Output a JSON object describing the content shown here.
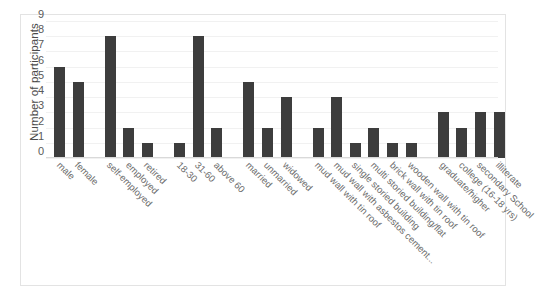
{
  "chart_data": {
    "type": "bar",
    "title": "",
    "xlabel": "",
    "ylabel": "Number of participants",
    "ylim": [
      0,
      9
    ],
    "ytick_labels": [
      "0",
      "1",
      "2",
      "3",
      "4",
      "5",
      "6",
      "7",
      "8",
      "9"
    ],
    "grid": true,
    "legend": "none",
    "orientation": "vertical",
    "bar_color": "#3d3d3d",
    "gridline_color": "#f1f1f1",
    "axis_color": "#d9d9d9",
    "label_color": "#6b6b6b",
    "categories": [
      "male",
      "female",
      "self-employed",
      "employed",
      "retired",
      "18-30",
      "31-60",
      "above 60",
      "married",
      "unmarried",
      "widowed",
      "mud wall with tin roof",
      "mud wall with asbestos cement...",
      "single storied building",
      "multi storied building/flat",
      "brick wall with tin roof",
      "wooden wall with tin roof",
      "graduate/higher",
      "college (16-18 yrs)",
      "secondary School",
      "illiterate"
    ],
    "values": [
      6,
      5,
      8,
      2,
      1,
      1,
      8,
      2,
      5,
      2,
      4,
      2,
      4,
      1,
      2,
      1,
      1,
      3,
      2,
      3,
      3
    ],
    "groups": [
      {
        "name": "gender",
        "categories": [
          "male",
          "female"
        ],
        "values": [
          6,
          5
        ]
      },
      {
        "name": "occupation",
        "categories": [
          "self-employed",
          "employed",
          "retired"
        ],
        "values": [
          8,
          2,
          1
        ]
      },
      {
        "name": "age",
        "categories": [
          "18-30",
          "31-60",
          "above 60"
        ],
        "values": [
          1,
          8,
          2
        ]
      },
      {
        "name": "marital-status",
        "categories": [
          "married",
          "unmarried",
          "widowed"
        ],
        "values": [
          5,
          2,
          4
        ]
      },
      {
        "name": "housing",
        "categories": [
          "mud wall with tin roof",
          "mud wall with asbestos cement...",
          "single storied building",
          "multi storied building/flat",
          "brick wall with tin roof",
          "wooden wall with tin roof"
        ],
        "values": [
          2,
          4,
          1,
          2,
          1,
          1
        ]
      },
      {
        "name": "education",
        "categories": [
          "graduate/higher",
          "college (16-18 yrs)",
          "secondary School",
          "illiterate"
        ],
        "values": [
          3,
          2,
          3,
          3
        ]
      }
    ]
  }
}
